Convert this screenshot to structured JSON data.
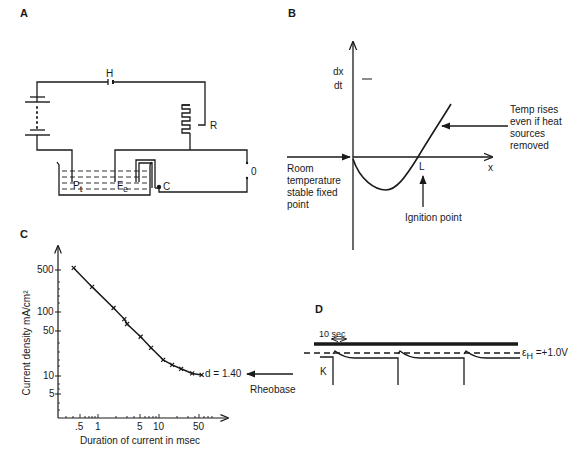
{
  "panels": {
    "a": {
      "label": "A",
      "components": {
        "h": "H",
        "r": "R",
        "pt_main": "P",
        "pt_sub": "t",
        "fe_main": "F",
        "fe_sub": "e",
        "c": "C",
        "switch": "0"
      }
    },
    "b": {
      "label": "B",
      "y_label_num": "dx",
      "y_label_den": "dt",
      "x_label": "x",
      "l_label": "L",
      "annot_rises": [
        "Temp rises",
        "even if heat",
        "sources",
        "removed"
      ],
      "annot_room": [
        "Room",
        "temperature",
        "stable fixed",
        "point"
      ],
      "annot_ignition": "Ignition point"
    },
    "c": {
      "label": "C",
      "annot_d": "d = 1.40",
      "annot_rheobase": "Rheobase"
    },
    "d": {
      "label": "D",
      "scale_label": "10 sec",
      "k_label": "K",
      "eh_symbol": "ε",
      "eh_sub": "H",
      "eh_value": " =+1.0V"
    }
  },
  "chart_data": [
    {
      "panel": "B",
      "type": "line",
      "title": "",
      "xlabel": "x",
      "ylabel": "dx/dt",
      "description": "Schematic curve: starts at origin, dips below zero, crosses zero at ignition point L, then rises steeply",
      "points": [
        [
          0,
          0
        ],
        [
          0.2,
          -0.6
        ],
        [
          0.33,
          -0.75
        ],
        [
          0.5,
          -0.5
        ],
        [
          0.68,
          0
        ],
        [
          1.0,
          1.3
        ]
      ],
      "annotations": [
        "Room temperature stable fixed point",
        "Ignition point",
        "L",
        "Temp rises even if heat sources removed"
      ],
      "grid": false
    },
    {
      "panel": "C",
      "type": "line",
      "title": "",
      "xlabel": "Duration of current in msec",
      "ylabel": "Current density mA/cm²",
      "xscale": "log",
      "yscale": "log",
      "x_ticks": [
        ".5",
        "1",
        "5",
        "10",
        "50"
      ],
      "y_ticks": [
        "500",
        "100",
        "50",
        "10",
        "5"
      ],
      "x": [
        0.4,
        0.8,
        1.8,
        2.7,
        3.0,
        5.0,
        7.4,
        11.7,
        16.4,
        23,
        35,
        50
      ],
      "values": [
        520,
        260,
        120,
        80,
        67,
        42,
        28,
        18,
        15,
        13,
        11,
        10.4
      ],
      "annotations": [
        "d = 1.40",
        "Rheobase"
      ],
      "grid": false
    },
    {
      "panel": "D",
      "type": "line",
      "xlabel": "",
      "ylabel": "",
      "description": "Potential trace with three periodic downward spikes to K, relaxing to just below dashed reference level",
      "spike_count": 3,
      "reference_line": "εH = +1.0V",
      "scale_bar": "10 sec"
    }
  ]
}
